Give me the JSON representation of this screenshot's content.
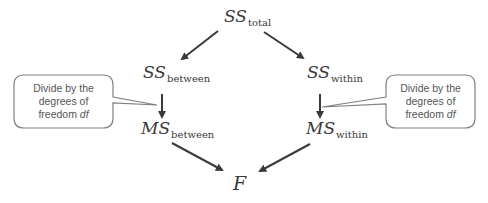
{
  "diagram": {
    "nodes": {
      "ss_total": {
        "main": "SS",
        "sub": "total"
      },
      "ss_between": {
        "main": "SS",
        "sub": "between"
      },
      "ss_within": {
        "main": "SS",
        "sub": "within"
      },
      "ms_between": {
        "main": "MS",
        "sub": "between"
      },
      "ms_within": {
        "main": "MS",
        "sub": "within"
      },
      "f": {
        "main": "F"
      }
    },
    "callouts": {
      "left": {
        "line1": "Divide by the",
        "line2": "degrees of",
        "line3_prefix": "freedom ",
        "line3_var": "df"
      },
      "right": {
        "line1": "Divide by the",
        "line2": "degrees of",
        "line3_prefix": "freedom ",
        "line3_var": "df"
      }
    },
    "edges": [
      {
        "from": "ss_total",
        "to": "ss_between"
      },
      {
        "from": "ss_total",
        "to": "ss_within"
      },
      {
        "from": "ss_between",
        "to": "ms_between"
      },
      {
        "from": "ss_within",
        "to": "ms_within"
      },
      {
        "from": "ms_between",
        "to": "f"
      },
      {
        "from": "ms_within",
        "to": "f"
      }
    ],
    "colors": {
      "arrow": "#3a3a3a",
      "callout_border": "#808080",
      "callout_text": "#555555",
      "text": "#3a3a3a"
    }
  }
}
